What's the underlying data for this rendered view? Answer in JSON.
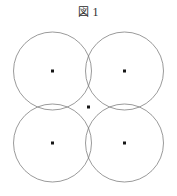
{
  "figure": {
    "caption_label": "図",
    "caption_number": "1",
    "caption_full": "図 1",
    "background_color": "#ffffff",
    "stroke_color": "#6e6e6e",
    "dot_color": "#161616",
    "stroke_width": 0.7,
    "dot_size": 3,
    "canvas": {
      "width": 177,
      "height": 196
    }
  },
  "chart_data": {
    "type": "diagram",
    "shape": "circle",
    "count": 4,
    "radius": 39,
    "common_point": {
      "x": 88.5,
      "y": 107
    },
    "circles": [
      {
        "name": "top-left",
        "cx": 52.5,
        "cy": 71,
        "r": 39,
        "dot": {
          "x": 52.5,
          "y": 71
        }
      },
      {
        "name": "top-right",
        "cx": 124.5,
        "cy": 71,
        "r": 39,
        "dot": {
          "x": 124.5,
          "y": 71
        }
      },
      {
        "name": "bottom-left",
        "cx": 52.5,
        "cy": 143,
        "r": 39,
        "dot": {
          "x": 52.5,
          "y": 143
        }
      },
      {
        "name": "bottom-right",
        "cx": 124.5,
        "cy": 143,
        "r": 39,
        "dot": {
          "x": 124.5,
          "y": 143
        }
      }
    ],
    "center_dots": [
      {
        "label": "top-left-center",
        "x": 52.5,
        "y": 71
      },
      {
        "label": "top-right-center",
        "x": 124.5,
        "y": 71
      },
      {
        "label": "bottom-left-center",
        "x": 52.5,
        "y": 143
      },
      {
        "label": "bottom-right-center",
        "x": 124.5,
        "y": 143
      },
      {
        "label": "common-intersection",
        "x": 88.5,
        "y": 107
      }
    ],
    "xlim": [
      13,
      164
    ],
    "ylim": [
      30,
      186
    ],
    "grid": false,
    "legend": null
  }
}
